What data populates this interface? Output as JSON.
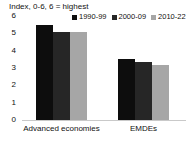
{
  "chart_data": {
    "type": "bar",
    "title": "Index, 0-6, 6 = highest",
    "xlabel": "",
    "ylabel": "",
    "ylim": [
      0,
      6
    ],
    "yticks": [
      "0",
      "1",
      "2",
      "3",
      "4",
      "5",
      "6"
    ],
    "grid": false,
    "legend_position": "top-right",
    "categories": [
      "Advanced economies",
      "EMDEs"
    ],
    "series": [
      {
        "name": "1990-99",
        "color": "#0d0d0d",
        "values": [
          5.5,
          3.5
        ]
      },
      {
        "name": "2000-09",
        "color": "#262626",
        "values": [
          5.1,
          3.35
        ]
      },
      {
        "name": "2010-22",
        "color": "#a6a6a6",
        "values": [
          5.05,
          3.15
        ]
      }
    ]
  }
}
